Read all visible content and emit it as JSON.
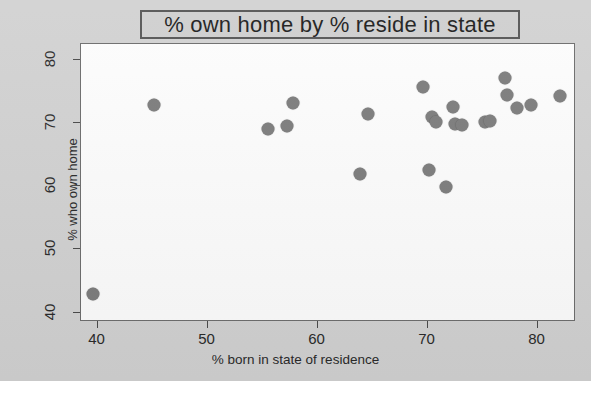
{
  "chart_data": {
    "type": "scatter",
    "title": "% own home by % reside in state",
    "xlabel": "% born in state of residence",
    "ylabel": "% who own home",
    "xlim": [
      38.5,
      83.5
    ],
    "ylim": [
      38.5,
      82.5
    ],
    "xticks": [
      40,
      50,
      60,
      70,
      80
    ],
    "yticks": [
      40,
      50,
      60,
      70,
      80
    ],
    "grid": false,
    "legend": null,
    "marker_color": "#7d7d7d",
    "points": [
      {
        "x": 39.6,
        "y": 43.0
      },
      {
        "x": 45.1,
        "y": 72.8
      },
      {
        "x": 55.5,
        "y": 69.0
      },
      {
        "x": 57.2,
        "y": 69.5
      },
      {
        "x": 57.8,
        "y": 73.2
      },
      {
        "x": 63.9,
        "y": 62.0
      },
      {
        "x": 64.6,
        "y": 71.5
      },
      {
        "x": 69.6,
        "y": 75.7
      },
      {
        "x": 70.1,
        "y": 62.6
      },
      {
        "x": 70.4,
        "y": 70.9
      },
      {
        "x": 70.8,
        "y": 70.1
      },
      {
        "x": 71.7,
        "y": 59.9
      },
      {
        "x": 72.3,
        "y": 72.6
      },
      {
        "x": 72.5,
        "y": 69.8
      },
      {
        "x": 73.1,
        "y": 69.7
      },
      {
        "x": 75.2,
        "y": 70.1
      },
      {
        "x": 75.7,
        "y": 70.3
      },
      {
        "x": 77.0,
        "y": 77.1
      },
      {
        "x": 77.2,
        "y": 74.4
      },
      {
        "x": 78.1,
        "y": 72.4
      },
      {
        "x": 79.4,
        "y": 72.9
      },
      {
        "x": 82.0,
        "y": 74.2
      }
    ]
  },
  "figure": {
    "background_color": "#d2d2d2",
    "plot_background_color": "#fdfdfd",
    "title_box_border_color": "#555555"
  }
}
